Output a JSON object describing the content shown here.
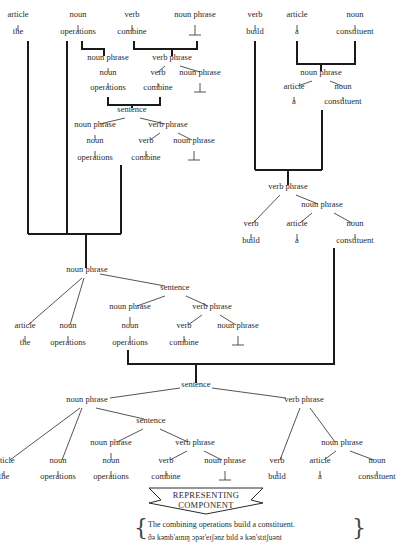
{
  "figure": {
    "banner": {
      "line1": "REPRESENTING",
      "line2": "COMPONENT"
    },
    "output": {
      "orthographic": "The combining operations build a constituent.",
      "phonetic": "ðə kəmb'aɪnɪŋ ɔpər'eɪʃənz bɪld ə kən'stɪtʃuənt"
    }
  },
  "nodes": [
    {
      "id": "a1",
      "text": "article",
      "x": 18,
      "y": 15
    },
    {
      "id": "a1w",
      "text": "the",
      "x": 18,
      "y": 32
    },
    {
      "id": "b1",
      "text": "noun",
      "x": 78,
      "y": 15
    },
    {
      "id": "b1w",
      "text": "operations",
      "x": 78,
      "y": 32
    },
    {
      "id": "c1",
      "text": "verb",
      "x": 132,
      "y": 15
    },
    {
      "id": "c1w",
      "text": "combine",
      "x": 132,
      "y": 32
    },
    {
      "id": "d1",
      "text": "noun phrase",
      "x": 195,
      "y": 15
    },
    {
      "id": "e1",
      "text": "noun phrase",
      "x": 108,
      "y": 58
    },
    {
      "id": "e2",
      "text": "noun",
      "x": 108,
      "y": 73
    },
    {
      "id": "e3",
      "text": "operations",
      "x": 108,
      "y": 88
    },
    {
      "id": "f1",
      "text": "verb phrase",
      "x": 172,
      "y": 58
    },
    {
      "id": "f2",
      "text": "verb",
      "x": 158,
      "y": 73
    },
    {
      "id": "f3",
      "text": "combine",
      "x": 158,
      "y": 88
    },
    {
      "id": "f4",
      "text": "noun phrase",
      "x": 200,
      "y": 73
    },
    {
      "id": "g1",
      "text": "sentence",
      "x": 132,
      "y": 110
    },
    {
      "id": "g2",
      "text": "noun phrase",
      "x": 95,
      "y": 125
    },
    {
      "id": "g3",
      "text": "noun",
      "x": 95,
      "y": 141
    },
    {
      "id": "g4",
      "text": "operations",
      "x": 95,
      "y": 158
    },
    {
      "id": "g5",
      "text": "verb phrase",
      "x": 168,
      "y": 125
    },
    {
      "id": "g6",
      "text": "verb",
      "x": 146,
      "y": 141
    },
    {
      "id": "g7",
      "text": "combine",
      "x": 146,
      "y": 158
    },
    {
      "id": "g8",
      "text": "noun phrase",
      "x": 194,
      "y": 141
    },
    {
      "id": "h1",
      "text": "verb",
      "x": 255,
      "y": 15
    },
    {
      "id": "h1w",
      "text": "build",
      "x": 255,
      "y": 32
    },
    {
      "id": "h2",
      "text": "article",
      "x": 297,
      "y": 15
    },
    {
      "id": "h2w",
      "text": "a",
      "x": 297,
      "y": 32
    },
    {
      "id": "h3",
      "text": "noun",
      "x": 355,
      "y": 15
    },
    {
      "id": "h3w",
      "text": "constituent",
      "x": 355,
      "y": 32
    },
    {
      "id": "i1",
      "text": "noun phrase",
      "x": 321,
      "y": 73
    },
    {
      "id": "i2",
      "text": "article",
      "x": 294,
      "y": 87
    },
    {
      "id": "i3",
      "text": "a",
      "x": 294,
      "y": 102
    },
    {
      "id": "i4",
      "text": "noun",
      "x": 343,
      "y": 87
    },
    {
      "id": "i5",
      "text": "constituent",
      "x": 343,
      "y": 102
    },
    {
      "id": "j1",
      "text": "verb phrase",
      "x": 288,
      "y": 187
    },
    {
      "id": "j2",
      "text": "noun phrase",
      "x": 322,
      "y": 205
    },
    {
      "id": "j3",
      "text": "verb",
      "x": 251,
      "y": 224
    },
    {
      "id": "j4",
      "text": "build",
      "x": 251,
      "y": 241
    },
    {
      "id": "j5",
      "text": "article",
      "x": 297,
      "y": 224
    },
    {
      "id": "j6",
      "text": "a",
      "x": 297,
      "y": 241
    },
    {
      "id": "j7",
      "text": "noun",
      "x": 355,
      "y": 224
    },
    {
      "id": "j8",
      "text": "constituent",
      "x": 355,
      "y": 241
    },
    {
      "id": "k1",
      "text": "noun phrase",
      "x": 87,
      "y": 270
    },
    {
      "id": "k2",
      "text": "sentence",
      "x": 175,
      "y": 288
    },
    {
      "id": "k3",
      "text": "noun phrase",
      "x": 130,
      "y": 307
    },
    {
      "id": "k4",
      "text": "noun",
      "x": 130,
      "y": 326
    },
    {
      "id": "k5",
      "text": "operations",
      "x": 130,
      "y": 343
    },
    {
      "id": "k6",
      "text": "verb phrase",
      "x": 212,
      "y": 307
    },
    {
      "id": "k7",
      "text": "verb",
      "x": 184,
      "y": 326
    },
    {
      "id": "k8",
      "text": "combine",
      "x": 184,
      "y": 343
    },
    {
      "id": "k9",
      "text": "noun phrase",
      "x": 238,
      "y": 326
    },
    {
      "id": "k10",
      "text": "article",
      "x": 25,
      "y": 326
    },
    {
      "id": "k11",
      "text": "the",
      "x": 25,
      "y": 343
    },
    {
      "id": "k12",
      "text": "noun",
      "x": 68,
      "y": 326
    },
    {
      "id": "k13",
      "text": "operations",
      "x": 68,
      "y": 343
    },
    {
      "id": "m1",
      "text": "sentence",
      "x": 196,
      "y": 385
    },
    {
      "id": "m2",
      "text": "noun phrase",
      "x": 87,
      "y": 400
    },
    {
      "id": "m3",
      "text": "sentence",
      "x": 151,
      "y": 421
    },
    {
      "id": "m4",
      "text": "noun phrase",
      "x": 111,
      "y": 443
    },
    {
      "id": "m5",
      "text": "noun",
      "x": 111,
      "y": 461
    },
    {
      "id": "m6",
      "text": "operations",
      "x": 111,
      "y": 477
    },
    {
      "id": "m7",
      "text": "verb phrase",
      "x": 195,
      "y": 443
    },
    {
      "id": "m8",
      "text": "verb",
      "x": 166,
      "y": 461
    },
    {
      "id": "m9",
      "text": "combine",
      "x": 166,
      "y": 477
    },
    {
      "id": "m10",
      "text": "noun phrase",
      "x": 225,
      "y": 461
    },
    {
      "id": "m11",
      "text": "article",
      "x": 4,
      "y": 461
    },
    {
      "id": "m12",
      "text": "the",
      "x": 4,
      "y": 477
    },
    {
      "id": "m13",
      "text": "noun",
      "x": 58,
      "y": 461
    },
    {
      "id": "m14",
      "text": "operations",
      "x": 58,
      "y": 477
    },
    {
      "id": "m15",
      "text": "verb phrase",
      "x": 304,
      "y": 400
    },
    {
      "id": "m16",
      "text": "noun phrase",
      "x": 342,
      "y": 443
    },
    {
      "id": "m17",
      "text": "verb",
      "x": 277,
      "y": 461
    },
    {
      "id": "m18",
      "text": "build",
      "x": 277,
      "y": 477
    },
    {
      "id": "m19",
      "text": "article",
      "x": 320,
      "y": 461
    },
    {
      "id": "m20",
      "text": "a",
      "x": 320,
      "y": 477
    },
    {
      "id": "m21",
      "text": "noun",
      "x": 377,
      "y": 461
    },
    {
      "id": "m22",
      "text": "constituent",
      "x": 377,
      "y": 477
    }
  ]
}
